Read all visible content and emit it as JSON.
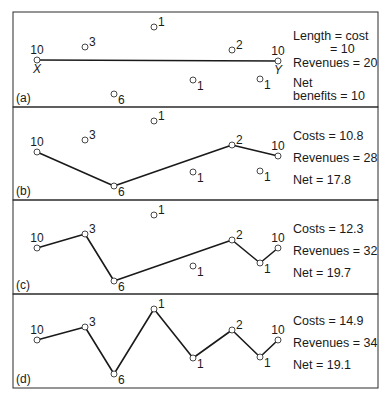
{
  "figure": {
    "nodes": [
      {
        "id": "X",
        "revenue": "10",
        "x": 37,
        "dy": 0,
        "label_pos": "above",
        "sublabel": "X"
      },
      {
        "id": "n3",
        "revenue": "3",
        "x": 85,
        "label_pos": "right-up"
      },
      {
        "id": "n6",
        "revenue": "6",
        "x": 114,
        "label_pos": "right-down"
      },
      {
        "id": "n1a",
        "revenue": "1",
        "x": 154,
        "label_pos": "right-up"
      },
      {
        "id": "n1b",
        "revenue": "1",
        "x": 193,
        "label_pos": "right-down"
      },
      {
        "id": "n2",
        "revenue": "2",
        "x": 232,
        "label_pos": "right-up"
      },
      {
        "id": "n1c",
        "revenue": "1",
        "x": 260,
        "label_pos": "right-down"
      },
      {
        "id": "Y",
        "revenue": "10",
        "x": 278,
        "label_pos": "above",
        "sublabel": "Y"
      }
    ],
    "panels": [
      {
        "tag": "(a)",
        "top": 12,
        "bottom": 107,
        "node_y": {
          "X": 60,
          "n3": 47,
          "n6": 94,
          "n1a": 27,
          "n1b": 80,
          "n2": 50,
          "n1c": 79,
          "Y": 61
        },
        "route": [
          "X",
          "Y"
        ],
        "show_xy_letters": true,
        "stats": [
          {
            "label": "Length = cost",
            "y": 40
          },
          {
            "label": "= 10",
            "y": 53,
            "indent": 37
          },
          {
            "label": "Revenues = 20",
            "y": 67
          },
          {
            "label": "Net",
            "y": 87
          },
          {
            "label": "benefits = 10",
            "y": 100
          }
        ]
      },
      {
        "tag": "(b)",
        "top": 107,
        "bottom": 200,
        "node_y": {
          "X": 152,
          "n3": 140,
          "n6": 186,
          "n1a": 121,
          "n1b": 172,
          "n2": 145,
          "n1c": 171,
          "Y": 156
        },
        "route": [
          "X",
          "n6",
          "n2",
          "Y"
        ],
        "show_xy_letters": false,
        "stats": [
          {
            "label": "Costs = 10.8",
            "y": 140
          },
          {
            "label": "Revenues = 28",
            "y": 162
          },
          {
            "label": "Net = 17.8",
            "y": 184
          }
        ]
      },
      {
        "tag": "(c)",
        "top": 200,
        "bottom": 294,
        "node_y": {
          "X": 248,
          "n3": 234,
          "n6": 281,
          "n1a": 215,
          "n1b": 266,
          "n2": 240,
          "n1c": 263,
          "Y": 248
        },
        "route": [
          "X",
          "n3",
          "n6",
          "n2",
          "n1c",
          "Y"
        ],
        "show_xy_letters": false,
        "stats": [
          {
            "label": "Costs = 12.3",
            "y": 233
          },
          {
            "label": "Revenues = 32",
            "y": 255
          },
          {
            "label": "Net = 19.7",
            "y": 277
          }
        ]
      },
      {
        "tag": "(d)",
        "top": 294,
        "bottom": 388,
        "node_y": {
          "X": 340,
          "n3": 327,
          "n6": 374,
          "n1a": 309,
          "n1b": 358,
          "n2": 330,
          "n1c": 357,
          "Y": 340
        },
        "route": [
          "X",
          "n3",
          "n6",
          "n1a",
          "n1b",
          "n2",
          "n1c",
          "Y"
        ],
        "show_xy_letters": false,
        "stats": [
          {
            "label": "Costs = 14.9",
            "y": 325
          },
          {
            "label": "Revenues = 34",
            "y": 347
          },
          {
            "label": "Net = 19.1",
            "y": 369
          }
        ]
      }
    ],
    "frame": {
      "left": 13,
      "right": 378
    },
    "stats_x": 293,
    "colors": {
      "line": "#1a1a1a",
      "border": "#2a2a2a",
      "node_fill": "#ffffff",
      "background": "#ffffff"
    }
  }
}
